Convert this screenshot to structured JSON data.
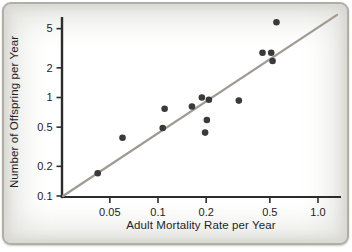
{
  "figure": {
    "card_background": "#ffffff",
    "card_border_color": "#b2aea6",
    "card_edge_shade": "#d7d7d1"
  },
  "chart_data": {
    "type": "scatter",
    "title": "",
    "xlabel": "Adult Mortality Rate per Year",
    "ylabel": "Number of Offspring per Year",
    "x_scale": "log",
    "y_scale": "log",
    "xlim": [
      0.025,
      1.4
    ],
    "ylim": [
      0.095,
      8
    ],
    "grid": false,
    "legend": null,
    "x_ticks": [
      {
        "v": 0.05,
        "label": "0.05"
      },
      {
        "v": 0.1,
        "label": "0.1"
      },
      {
        "v": 0.2,
        "label": "0.2"
      },
      {
        "v": 0.5,
        "label": "0.5"
      },
      {
        "v": 1.0,
        "label": "1.0"
      }
    ],
    "y_ticks": [
      {
        "v": 5,
        "label": "5"
      },
      {
        "v": 2,
        "label": "2"
      },
      {
        "v": 1,
        "label": "1"
      },
      {
        "v": 0.5,
        "label": "0.5"
      },
      {
        "v": 0.2,
        "label": "0.2"
      },
      {
        "v": 0.1,
        "label": "0.1"
      }
    ],
    "points": [
      [
        0.042,
        0.17
      ],
      [
        0.06,
        0.39
      ],
      [
        0.107,
        0.49
      ],
      [
        0.11,
        0.77
      ],
      [
        0.163,
        0.81
      ],
      [
        0.188,
        1.0
      ],
      [
        0.197,
        0.44
      ],
      [
        0.202,
        0.59
      ],
      [
        0.208,
        0.95
      ],
      [
        0.32,
        0.93
      ],
      [
        0.45,
        2.85
      ],
      [
        0.51,
        2.85
      ],
      [
        0.52,
        2.35
      ],
      [
        0.55,
        5.8
      ]
    ],
    "trend_line": {
      "x1": 0.0255,
      "y1": 0.1,
      "x2": 1.315,
      "y2": 6.9
    },
    "point_color": "#3a3a3a",
    "line_color": "#a19a93",
    "axis_color": "#2c2c2c",
    "text_color": "#222222"
  }
}
